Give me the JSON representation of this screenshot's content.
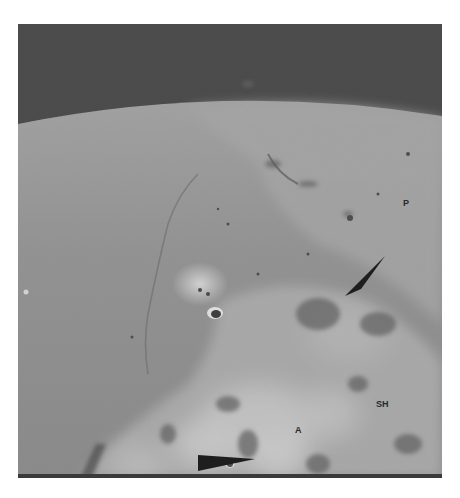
{
  "image": {
    "subject": "oblique orbital view of the lunar surface with horizon and dark sky",
    "colors": {
      "sky": "#3c3c3c",
      "mare": "#8c8c8c",
      "highland": "#b5b5b5",
      "bright_ejecta": "#e6e6e6",
      "arrow": "#1e1e1e"
    }
  },
  "annotations": {
    "labels": [
      {
        "text": "P"
      },
      {
        "text": "SH"
      },
      {
        "text": "A"
      }
    ],
    "arrows": [
      {
        "name": "upper-right-pointer"
      },
      {
        "name": "bottom-pointer"
      }
    ]
  }
}
